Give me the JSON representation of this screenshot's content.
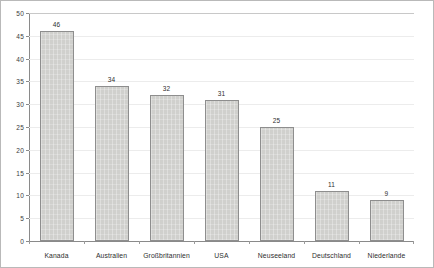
{
  "chart_data": {
    "type": "bar",
    "title": "",
    "subtitle": "",
    "xlabel": "",
    "ylabel": "",
    "categories": [
      "Kanada",
      "Australien",
      "Großbritannien",
      "USA",
      "Neuseeland",
      "Deutschland",
      "Niederlande"
    ],
    "values": [
      46,
      34,
      32,
      31,
      25,
      11,
      9
    ],
    "value_labels": [
      "46",
      "34",
      "32",
      "31",
      "25",
      "11",
      "9"
    ],
    "ylim": [
      0,
      50
    ],
    "ytick_values": [
      0,
      5,
      10,
      15,
      20,
      25,
      30,
      35,
      40,
      45,
      50
    ],
    "ytick_labels": [
      "0",
      "5",
      "10",
      "15",
      "20",
      "25",
      "30",
      "35",
      "40",
      "45",
      "50"
    ],
    "grid": "horizontal",
    "legend": "none",
    "bar_color": "#d0d0cd",
    "bar_border_color": "#8e8e8e",
    "axis_color": "#8a8a8a",
    "grid_color": "#ececec",
    "background_color": "#ffffff",
    "frame_color": "#b9b9b9"
  }
}
